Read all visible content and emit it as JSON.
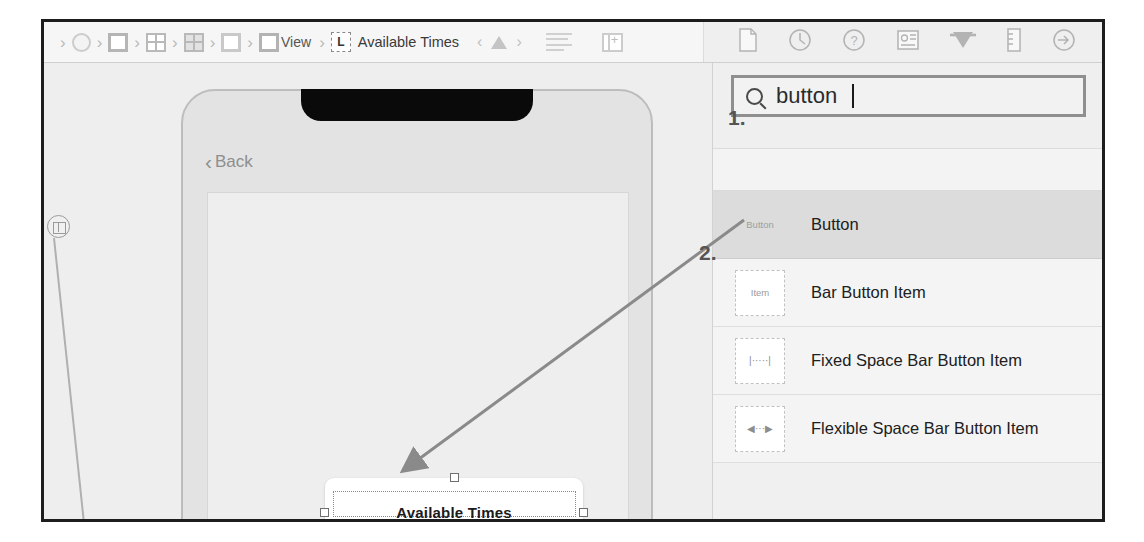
{
  "window": {
    "app": "Xcode Interface Builder"
  },
  "toolbar": {
    "breadcrumbs": [
      {
        "icon": "project-circle-icon",
        "label": ""
      },
      {
        "icon": "target-square-icon",
        "label": ""
      },
      {
        "icon": "storyboard-grid-icon",
        "label": ""
      },
      {
        "icon": "scene-grid-icon",
        "label": ""
      },
      {
        "icon": "viewcontroller-square-icon",
        "label": ""
      },
      {
        "icon": "view-square-icon",
        "label": "View"
      }
    ],
    "selected_crumb": {
      "badge": "L",
      "label": "Available Times"
    },
    "nav_back": "‹",
    "nav_forward": "›",
    "warning_icon": "warning-triangle-icon",
    "lines_icon": "document-lines-icon",
    "panel_icon": "add-panel-icon",
    "inspector_tabs": [
      "file-inspector-icon",
      "history-inspector-icon",
      "quick-help-inspector-icon",
      "identity-inspector-icon",
      "attributes-inspector-icon",
      "size-inspector-icon",
      "connections-inspector-icon"
    ]
  },
  "canvas": {
    "back_button": "Back",
    "back_chevron": "‹",
    "selected_label": "Available Times",
    "constraint_badge_icon": "leading-constraint-icon"
  },
  "library": {
    "search": {
      "value": "button",
      "placeholder": "Filter",
      "icon": "search-icon"
    },
    "items": [
      {
        "thumb": "Button",
        "thumb_style": "plain",
        "name": "Button",
        "selected": true
      },
      {
        "thumb": "Item",
        "thumb_style": "box",
        "name": "Bar Button Item",
        "selected": false
      },
      {
        "thumb": "|·····|",
        "thumb_style": "fixed",
        "name": "Fixed Space Bar Button Item",
        "selected": false
      },
      {
        "thumb": "◀···▶",
        "thumb_style": "flex",
        "name": "Flexible Space Bar Button Item",
        "selected": false
      }
    ]
  },
  "annotations": {
    "step1": "1.",
    "step2": "2.",
    "drag_arrow": "drag-from-library-to-canvas"
  },
  "colors": {
    "frame_border": "#1d1d1d",
    "toolbar_bg": "#f6f6f6",
    "canvas_bg": "#eeeeee",
    "library_bg": "#f0f0f0",
    "selected_row": "#dcdcdc",
    "notch": "#0a0a0a",
    "annotation": "#555555"
  }
}
